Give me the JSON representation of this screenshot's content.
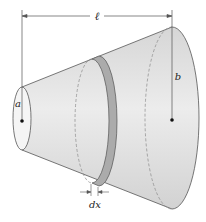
{
  "figure": {
    "type": "truncated-cone-with-slice",
    "labels": {
      "length": "ℓ",
      "small_radius": "a",
      "large_radius": "b",
      "slice_thickness": "dx"
    },
    "colors": {
      "body_fill": "#dcdcdc",
      "body_light": "#ececec",
      "end_face": "#f4f4f4",
      "slice_face": "#cfcfcf",
      "slice_rim": "#a9a9a9",
      "outline": "#555555",
      "dashed": "#888888"
    }
  }
}
